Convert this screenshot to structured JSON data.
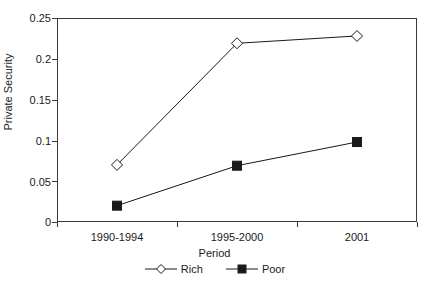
{
  "chart_data": {
    "type": "line",
    "title": "",
    "xlabel": "Period",
    "ylabel": "Private Security",
    "categories": [
      "1990-1994",
      "1995-2000",
      "2001"
    ],
    "series": [
      {
        "name": "Rich",
        "values": [
          0.07,
          0.219,
          0.228
        ],
        "marker": "open-diamond",
        "color": "#1a1a1a",
        "marker_fill": "#ffffff"
      },
      {
        "name": "Poor",
        "values": [
          0.02,
          0.069,
          0.098
        ],
        "marker": "filled-square",
        "color": "#1a1a1a",
        "marker_fill": "#1a1a1a"
      }
    ],
    "ylim": [
      0,
      0.25
    ],
    "y_ticks": [
      0,
      0.05,
      0.1,
      0.15,
      0.2,
      0.25
    ],
    "y_tick_labels": [
      "0",
      "0.05",
      "0.1",
      "0.15",
      "0.2",
      "0.25"
    ],
    "grid": false,
    "legend_position": "bottom"
  },
  "axis": {
    "y_title": "Private Security",
    "x_title": "Period"
  },
  "legend": {
    "entries": [
      {
        "label": "Rich"
      },
      {
        "label": "Poor"
      }
    ]
  }
}
